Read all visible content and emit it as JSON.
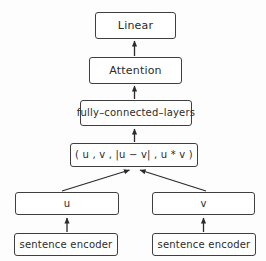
{
  "diagram": {
    "colors": {
      "border": "#3f3f3f",
      "box_fill": "#ffffff",
      "canvas": "#fdfdfd",
      "text": "#2b2b2b",
      "edge": "#2b2b2b"
    },
    "nodes": [
      {
        "id": "linear",
        "label": "Linear"
      },
      {
        "id": "attention",
        "label": "Attention"
      },
      {
        "id": "fcl",
        "label": "fully–connected–layers"
      },
      {
        "id": "tuple",
        "label": "( u , v , |u − v| , u * v )"
      },
      {
        "id": "u",
        "label": "u"
      },
      {
        "id": "v",
        "label": "v"
      },
      {
        "id": "enc_left",
        "label": "sentence encoder"
      },
      {
        "id": "enc_right",
        "label": "sentence encoder"
      }
    ],
    "edges": [
      {
        "id": "attention-to-linear",
        "from": "attention",
        "to": "linear",
        "style": "vertical-arrow"
      },
      {
        "id": "fcl-to-attention",
        "from": "fcl",
        "to": "attention",
        "style": "vertical-arrow"
      },
      {
        "id": "tuple-to-fcl",
        "from": "tuple",
        "to": "fcl",
        "style": "vertical-arrow"
      },
      {
        "id": "u-to-tuple",
        "from": "u",
        "to": "tuple",
        "style": "diagonal-arrow"
      },
      {
        "id": "v-to-tuple",
        "from": "v",
        "to": "tuple",
        "style": "diagonal-arrow"
      },
      {
        "id": "enc-left-to-u",
        "from": "enc_left",
        "to": "u",
        "style": "vertical-arrow"
      },
      {
        "id": "enc-right-to-v",
        "from": "enc_right",
        "to": "v",
        "style": "vertical-arrow"
      }
    ]
  }
}
